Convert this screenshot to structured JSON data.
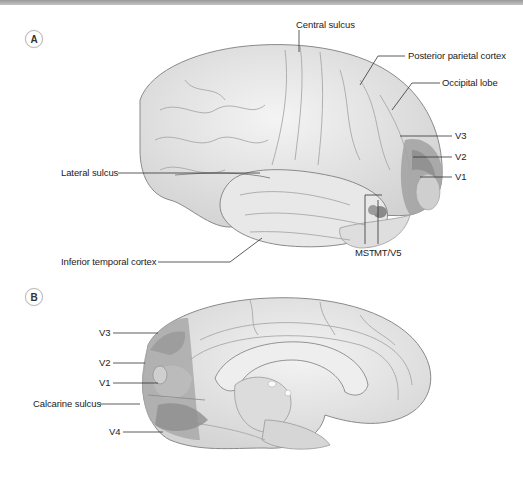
{
  "figure": {
    "panels": [
      {
        "id": "A",
        "view": "lateral",
        "labels": {
          "central_sulcus": "Central sulcus",
          "posterior_parietal_cortex": "Posterior parietal cortex",
          "occipital_lobe": "Occipital lobe",
          "v3": "V3",
          "v2": "V2",
          "v1": "V1",
          "lateral_sulcus": "Lateral sulcus",
          "inferior_temporal_cortex": "Inferior temporal cortex",
          "mst": "MST",
          "mt_v5": "MT/V5"
        }
      },
      {
        "id": "B",
        "view": "medial",
        "labels": {
          "v3": "V3",
          "v2": "V2",
          "v1": "V1",
          "calcarine_sulcus": "Calcarine sulcus",
          "v4": "V4"
        }
      }
    ],
    "colors": {
      "brain_fill": "#e6e6e6",
      "brain_outline": "#8a8a8a",
      "visual_area_dark": "#8f8f8f",
      "visual_area_mid": "#a8a8a8",
      "visual_area_light": "#c9c9c9",
      "leader_line": "#333333"
    }
  }
}
